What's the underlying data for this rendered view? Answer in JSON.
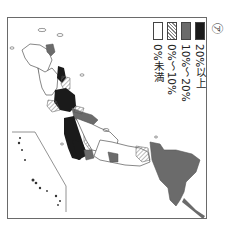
{
  "figure": {
    "marker": "㋐",
    "orientation": "rotated 90° clockwise"
  },
  "legend": {
    "items": [
      {
        "label": "20%以上",
        "fill": "#1a1a1a",
        "pattern": "solid"
      },
      {
        "label": "10%～20%",
        "fill": "#6b6b6b",
        "pattern": "solid"
      },
      {
        "label": "0%～10%",
        "fill": "#ffffff",
        "pattern": "hatched"
      },
      {
        "label": "0%未満",
        "fill": "#ffffff",
        "pattern": "blank"
      }
    ]
  },
  "colors": {
    "category_high": "#1a1a1a",
    "category_mid": "#6b6b6b",
    "hatch_line": "#777777",
    "outline": "#555555",
    "frame": "#6a6a6a"
  }
}
